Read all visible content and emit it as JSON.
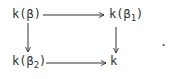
{
  "diagram": {
    "type": "commutative-square",
    "nodes": {
      "top_left": {
        "base": "k(β",
        "sub": "",
        "close": ")"
      },
      "top_right": {
        "base": "k(β",
        "sub": "1",
        "close": ")"
      },
      "bottom_left": {
        "base": "k(β",
        "sub": "2",
        "close": ")"
      },
      "bottom_right": {
        "base": "k",
        "sub": "",
        "close": ""
      }
    },
    "arrows": [
      {
        "from": "top_left",
        "to": "top_right"
      },
      {
        "from": "top_left",
        "to": "bottom_left"
      },
      {
        "from": "top_right",
        "to": "bottom_right"
      },
      {
        "from": "bottom_left",
        "to": "bottom_right"
      }
    ],
    "trailing_punctuation": "."
  }
}
